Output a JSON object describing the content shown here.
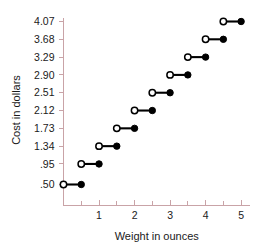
{
  "chart_data": {
    "type": "line",
    "subtype": "step-function",
    "title": "",
    "xlabel": "Weight in ounces",
    "ylabel": "Cost in dollars",
    "xlim": [
      0,
      5.25
    ],
    "ylim": [
      0.18,
      4.33
    ],
    "grid": false,
    "legend": null,
    "x_ticks_major": [
      1,
      2,
      3,
      4,
      5
    ],
    "x_tick_labels": [
      "1",
      "2",
      "3",
      "4",
      "5"
    ],
    "x_ticks_minor": [
      0.5,
      1.5,
      2.5,
      3.5,
      4.5
    ],
    "y_ticks": [
      0.5,
      0.95,
      1.34,
      1.73,
      2.12,
      2.51,
      2.9,
      3.29,
      3.68,
      4.07
    ],
    "y_tick_labels": [
      ".50",
      ".95",
      "1.34",
      "1.73",
      "2.12",
      "2.51",
      "2.90",
      "3.29",
      "3.68",
      "4.07"
    ],
    "segments": [
      {
        "y": 0.5,
        "y_label": ".50",
        "x_start": 0.0,
        "x_end": 0.5,
        "start_marker": "open",
        "end_marker": "closed"
      },
      {
        "y": 0.95,
        "y_label": ".95",
        "x_start": 0.5,
        "x_end": 1.0,
        "start_marker": "open",
        "end_marker": "closed"
      },
      {
        "y": 1.34,
        "y_label": "1.34",
        "x_start": 1.0,
        "x_end": 1.5,
        "start_marker": "open",
        "end_marker": "closed"
      },
      {
        "y": 1.73,
        "y_label": "1.73",
        "x_start": 1.5,
        "x_end": 2.0,
        "start_marker": "open",
        "end_marker": "closed"
      },
      {
        "y": 2.12,
        "y_label": "2.12",
        "x_start": 2.0,
        "x_end": 2.5,
        "start_marker": "open",
        "end_marker": "closed"
      },
      {
        "y": 2.51,
        "y_label": "2.51",
        "x_start": 2.5,
        "x_end": 3.0,
        "start_marker": "open",
        "end_marker": "closed"
      },
      {
        "y": 2.9,
        "y_label": "2.90",
        "x_start": 3.0,
        "x_end": 3.5,
        "start_marker": "open",
        "end_marker": "closed"
      },
      {
        "y": 3.29,
        "y_label": "3.29",
        "x_start": 3.5,
        "x_end": 4.0,
        "start_marker": "open",
        "end_marker": "closed"
      },
      {
        "y": 3.68,
        "y_label": "3.68",
        "x_start": 4.0,
        "x_end": 4.5,
        "start_marker": "open",
        "end_marker": "closed"
      },
      {
        "y": 4.07,
        "y_label": "4.07",
        "x_start": 4.5,
        "x_end": 5.0,
        "start_marker": "open",
        "end_marker": "closed"
      }
    ],
    "colors": {
      "background": "#ffffff",
      "axis": "#c9a3a7",
      "data": "#000000",
      "text": "#1a1a1a"
    }
  }
}
